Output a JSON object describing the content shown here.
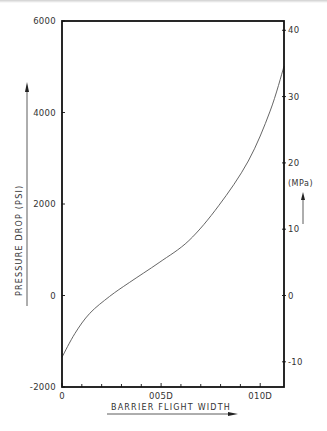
{
  "chart_data": {
    "type": "line",
    "title": "",
    "xlabel": "BARRIER FLIGHT WIDTH",
    "ylabel": "PRESSURE DROP (PSI)",
    "y2label": "(MPa)",
    "xlim": [
      0,
      0.0112
    ],
    "ylim": [
      -2000,
      6000
    ],
    "y2lim": [
      -13.8,
      41.4
    ],
    "grid": false,
    "legend": null,
    "x_ticks": [
      {
        "value": 0,
        "label": "0"
      },
      {
        "value": 0.001,
        "label": ""
      },
      {
        "value": 0.002,
        "label": ""
      },
      {
        "value": 0.003,
        "label": ""
      },
      {
        "value": 0.004,
        "label": ""
      },
      {
        "value": 0.005,
        "label": "005D"
      },
      {
        "value": 0.006,
        "label": ""
      },
      {
        "value": 0.007,
        "label": ""
      },
      {
        "value": 0.008,
        "label": ""
      },
      {
        "value": 0.009,
        "label": ""
      },
      {
        "value": 0.01,
        "label": "010D"
      }
    ],
    "y_ticks": [
      {
        "value": 6000,
        "label": "6000"
      },
      {
        "value": 4000,
        "label": "4000"
      },
      {
        "value": 2000,
        "label": "2000"
      },
      {
        "value": 0,
        "label": "0"
      },
      {
        "value": -2000,
        "label": "-2000"
      }
    ],
    "y2_ticks": [
      {
        "value": 40,
        "label": "40"
      },
      {
        "value": 30,
        "label": "30"
      },
      {
        "value": 20,
        "label": "20"
      },
      {
        "value": 10,
        "label": "10"
      },
      {
        "value": 0,
        "label": "0"
      },
      {
        "value": -10,
        "label": "-10"
      }
    ],
    "series": [
      {
        "name": "Pressure drop",
        "x": [
          0,
          0.00065,
          0.0014,
          0.0024,
          0.0034,
          0.0049,
          0.0064,
          0.0079,
          0.0094,
          0.0105,
          0.0112
        ],
        "y": [
          -1350,
          -830,
          -390,
          -20,
          285,
          720,
          1200,
          1960,
          2940,
          4030,
          5010
        ]
      }
    ]
  },
  "labels": {
    "x_axis_title": "BARRIER FLIGHT WIDTH",
    "y_axis_title": "PRESSURE DROP   (PSI)",
    "y2_axis_title": "(MPa)"
  }
}
